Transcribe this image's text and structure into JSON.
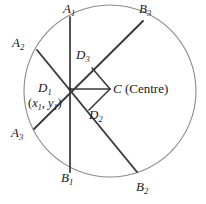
{
  "figure": {
    "width": 206,
    "height": 204,
    "stroke_color": "#3a3a3a",
    "circle_color": "#8a8a8a",
    "background": "#ffffff",
    "circle": {
      "cx": 110,
      "cy": 91,
      "r": 86
    },
    "points": {
      "D1": {
        "x": 70,
        "y": 89
      },
      "C": {
        "x": 110,
        "y": 89
      },
      "D3": {
        "x": 92,
        "y": 68
      },
      "D2": {
        "x": 89,
        "y": 110
      },
      "A1": {
        "x": 70,
        "y": 17
      },
      "B1": {
        "x": 70,
        "y": 172
      },
      "A2": {
        "x": 37,
        "y": 50
      },
      "B3": {
        "x": 143,
        "y": 21
      },
      "A3": {
        "x": 34,
        "y": 129
      },
      "B2": {
        "x": 137,
        "y": 172
      }
    },
    "chords": [
      {
        "name": "chord-A1-B1",
        "from": "A1",
        "to": "B1"
      },
      {
        "name": "chord-A2-B2",
        "from": "A2",
        "to": "B2"
      },
      {
        "name": "chord-A3-B3",
        "from": "A3",
        "to": "B3"
      }
    ],
    "perpendiculars": [
      {
        "name": "segment-D1-C",
        "from": "D1",
        "to": "C"
      },
      {
        "name": "segment-D3-C",
        "from": "D3",
        "to": "C"
      },
      {
        "name": "segment-D2-C",
        "from": "D2",
        "to": "C"
      }
    ],
    "labels": [
      {
        "id": "A1",
        "text": "A",
        "sub": "1",
        "x": 63,
        "y": 2,
        "name": "point-label-a1"
      },
      {
        "id": "B3",
        "text": "B",
        "sub": "3",
        "x": 139,
        "y": 2,
        "name": "point-label-b3"
      },
      {
        "id": "A2",
        "text": "A",
        "sub": "2",
        "x": 12,
        "y": 36,
        "name": "point-label-a2"
      },
      {
        "id": "D3",
        "text": "D",
        "sub": "3",
        "x": 76,
        "y": 48,
        "name": "point-label-d3"
      },
      {
        "id": "D1",
        "text": "D",
        "sub": "1",
        "x": 38,
        "y": 81,
        "name": "point-label-d1"
      },
      {
        "id": "D2",
        "text": "D",
        "sub": "2",
        "x": 89,
        "y": 108,
        "name": "point-label-d2"
      },
      {
        "id": "A3",
        "text": "A",
        "sub": "3",
        "x": 11,
        "y": 126,
        "name": "point-label-a3"
      },
      {
        "id": "B1",
        "text": "B",
        "sub": "1",
        "x": 61,
        "y": 171,
        "name": "point-label-b1"
      },
      {
        "id": "B2",
        "text": "B",
        "sub": "2",
        "x": 136,
        "y": 180,
        "name": "point-label-b2"
      }
    ],
    "centre_label": {
      "point": "C",
      "annotation": "(Centre)",
      "full_text": "C (Centre)",
      "x": 113,
      "y": 82,
      "name": "centre-label"
    },
    "coordinate_label": {
      "open": "(",
      "var_x": "x",
      "sub_x": "1",
      "comma": ", ",
      "var_y": "y",
      "sub_y": "1",
      "close": ")",
      "full_text": "(x1, y1)",
      "x": 28,
      "y": 97,
      "name": "coordinate-label-d1"
    }
  }
}
